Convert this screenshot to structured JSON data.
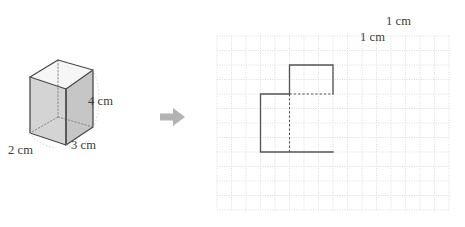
{
  "figure": {
    "arrow": {
      "icon": "right-arrow-icon",
      "color": "#b0b0b0",
      "direction": "right"
    }
  },
  "prism": {
    "name": "rectangular-prism",
    "labels": {
      "width": "2 cm",
      "depth": "3 cm",
      "height": "4 cm"
    },
    "dimensions": {
      "width_cm": 2,
      "depth_cm": 3,
      "height_cm": 4
    },
    "colors": {
      "outline": "#4a4a4a",
      "front_face": "#d2d2d2",
      "side_face": "#c3c3c3",
      "top_face": "#f4f4f4",
      "hidden_edge": "#8d8d8d"
    }
  },
  "grid": {
    "name": "centimetre-grid",
    "labels": {
      "horizontal_unit": "1 cm",
      "vertical_unit": "1 cm"
    },
    "columns": 16,
    "rows": 12,
    "cell_px": 14.5,
    "colors": {
      "grid_line": "#d8cfcf",
      "border": "#d8cfcf",
      "shape_stroke": "#555555",
      "hidden_stroke": "#555555"
    },
    "shape": {
      "name": "prism-footprint-outline",
      "description": "Two overlapping rectangles forming a stepped outline with one dashed internal edge",
      "upper_rect_cells": {
        "x": 3,
        "y": 2,
        "w": 2,
        "h": 2
      },
      "lower_rect_cells": {
        "x": 1,
        "y": 4,
        "w": 2,
        "h": 4
      },
      "tail_segment_cells": {
        "from_x": 3,
        "to_x": 4,
        "y": 8
      },
      "dashed_edges": [
        "upper-rect-bottom",
        "shared-vertical"
      ]
    }
  }
}
